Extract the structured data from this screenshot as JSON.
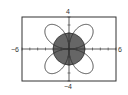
{
  "chart_data": {
    "type": "line",
    "subtype": "polar",
    "title": "",
    "xlabel": "",
    "ylabel": "",
    "xlim": [
      -6,
      6
    ],
    "ylim": [
      -4,
      4
    ],
    "tick_labels": {
      "x_min": "-6",
      "x_max": "6",
      "y_min": "-4",
      "y_max": "4"
    },
    "tick_spacing": 1,
    "grid": false,
    "series": [
      {
        "name": "rose curve",
        "equation": "r = 4 sin(2θ)",
        "style": "outline",
        "color": "#333333"
      },
      {
        "name": "circle region",
        "equation": "r = 2",
        "style": "filled",
        "color": "#666666"
      }
    ]
  },
  "labels": {
    "top": "4",
    "bottom": "−4",
    "left": "−6",
    "right": "6"
  },
  "colors": {
    "frame": "#333333",
    "fill": "#666666",
    "curve": "#333333",
    "background": "#ffffff"
  }
}
